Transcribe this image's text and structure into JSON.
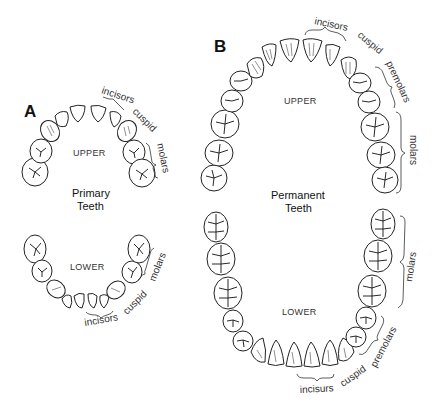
{
  "panels": {
    "a": {
      "letter": "A",
      "title_line1": "Primary",
      "title_line2": "Teeth",
      "upper_label": "UPPER",
      "lower_label": "LOWER",
      "upper_groups": {
        "incisors": "incisors",
        "cuspid": "cuspid",
        "molars": "molars"
      },
      "lower_groups": {
        "incisors": "incisors",
        "cuspid": "cuspid",
        "molars": "molars"
      }
    },
    "b": {
      "letter": "B",
      "title_line1": "Permanent",
      "title_line2": "Teeth",
      "upper_label": "UPPER",
      "lower_label": "LOWER",
      "upper_groups": {
        "incisors": "incisors",
        "cuspid": "cuspid",
        "premolars": "premolars",
        "molars": "molars"
      },
      "lower_groups": {
        "incisors": "incisurs",
        "cuspid": "cuspid",
        "premolars": "premolars",
        "molars": "molars"
      }
    }
  },
  "colors": {
    "line": "#222222",
    "text": "#333333",
    "background": "#ffffff"
  }
}
